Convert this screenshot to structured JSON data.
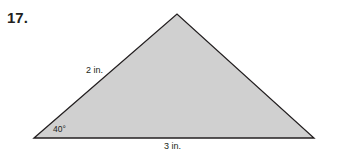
{
  "problem": {
    "number": "17.",
    "figure": {
      "shape": "triangle",
      "fill_color": "#d0d0d0",
      "stroke_color": "#231f20",
      "side_left_label": "2 in.",
      "angle_label": "40°",
      "base_label": "3 in."
    }
  }
}
